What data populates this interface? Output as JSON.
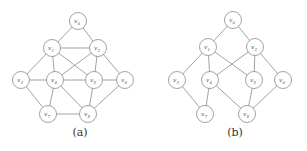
{
  "figures": [
    {
      "id": "a",
      "caption": "(a)",
      "nodes": [
        {
          "id": "v0",
          "label": "v",
          "sub": "0",
          "x": 78,
          "y": 21
        },
        {
          "id": "v1",
          "label": "v",
          "sub": "1",
          "x": 52,
          "y": 48
        },
        {
          "id": "v2",
          "label": "v",
          "sub": "2",
          "x": 98,
          "y": 48
        },
        {
          "id": "v3",
          "label": "v",
          "sub": "3",
          "x": 21,
          "y": 80
        },
        {
          "id": "v4",
          "label": "v",
          "sub": "4",
          "x": 55,
          "y": 80
        },
        {
          "id": "v5",
          "label": "v",
          "sub": "5",
          "x": 94,
          "y": 80
        },
        {
          "id": "v6",
          "label": "v",
          "sub": "6",
          "x": 125,
          "y": 80
        },
        {
          "id": "v7",
          "label": "v",
          "sub": "7",
          "x": 48,
          "y": 114
        },
        {
          "id": "v8",
          "label": "v",
          "sub": "8",
          "x": 88,
          "y": 114
        }
      ],
      "edges": [
        [
          "v0",
          "v1"
        ],
        [
          "v0",
          "v2"
        ],
        [
          "v1",
          "v2"
        ],
        [
          "v1",
          "v3"
        ],
        [
          "v1",
          "v4"
        ],
        [
          "v1",
          "v5"
        ],
        [
          "v2",
          "v4"
        ],
        [
          "v2",
          "v5"
        ],
        [
          "v2",
          "v6"
        ],
        [
          "v3",
          "v4"
        ],
        [
          "v4",
          "v5"
        ],
        [
          "v5",
          "v6"
        ],
        [
          "v3",
          "v7"
        ],
        [
          "v4",
          "v7"
        ],
        [
          "v4",
          "v8"
        ],
        [
          "v5",
          "v8"
        ],
        [
          "v6",
          "v8"
        ],
        [
          "v7",
          "v8"
        ]
      ],
      "caption_pos": {
        "x": 80,
        "y": 136
      }
    },
    {
      "id": "b",
      "caption": "(b)",
      "nodes": [
        {
          "id": "v0",
          "label": "v",
          "sub": "0",
          "x": 233,
          "y": 20
        },
        {
          "id": "v1",
          "label": "v",
          "sub": "1",
          "x": 208,
          "y": 47
        },
        {
          "id": "v2",
          "label": "v",
          "sub": "2",
          "x": 255,
          "y": 47
        },
        {
          "id": "v3",
          "label": "v",
          "sub": "3",
          "x": 177,
          "y": 80
        },
        {
          "id": "v4",
          "label": "v",
          "sub": "4",
          "x": 210,
          "y": 80
        },
        {
          "id": "v5",
          "label": "v",
          "sub": "5",
          "x": 254,
          "y": 80
        },
        {
          "id": "v6",
          "label": "v",
          "sub": "6",
          "x": 283,
          "y": 80
        },
        {
          "id": "v7",
          "label": "v",
          "sub": "7",
          "x": 205,
          "y": 114
        },
        {
          "id": "v8",
          "label": "v",
          "sub": "8",
          "x": 247,
          "y": 114
        }
      ],
      "edges": [
        [
          "v0",
          "v1"
        ],
        [
          "v0",
          "v2"
        ],
        [
          "v1",
          "v3"
        ],
        [
          "v1",
          "v4"
        ],
        [
          "v1",
          "v5"
        ],
        [
          "v2",
          "v4"
        ],
        [
          "v2",
          "v5"
        ],
        [
          "v2",
          "v6"
        ],
        [
          "v3",
          "v7"
        ],
        [
          "v4",
          "v7"
        ],
        [
          "v4",
          "v8"
        ],
        [
          "v5",
          "v8"
        ],
        [
          "v6",
          "v8"
        ]
      ],
      "caption_pos": {
        "x": 235,
        "y": 136
      }
    }
  ],
  "style": {
    "node_radius": 8.5,
    "stroke_color": "#8a8a8a",
    "background": "#ffffff"
  }
}
